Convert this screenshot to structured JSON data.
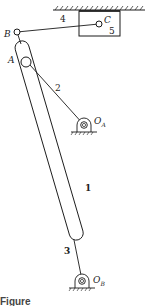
{
  "diagram": {
    "type": "mechanism linkage diagram",
    "stroke_color": "#1a1a1a",
    "labels": {
      "B": "B",
      "C": "C",
      "A": "A",
      "O_A_main": "O",
      "O_A_sub": "A",
      "O_B_main": "O",
      "O_B_sub": "B",
      "link_1": "1",
      "link_2": "2",
      "link_3": "3",
      "link_4": "4",
      "slider_5": "5"
    },
    "components": [
      {
        "id": "1",
        "name": "slotted bar"
      },
      {
        "id": "2",
        "name": "crank link O_A to A"
      },
      {
        "id": "3",
        "name": "link from bar to O_B"
      },
      {
        "id": "4",
        "name": "connecting rod B to C"
      },
      {
        "id": "5",
        "name": "slider in guide"
      }
    ],
    "caption_partial": "Figure"
  }
}
